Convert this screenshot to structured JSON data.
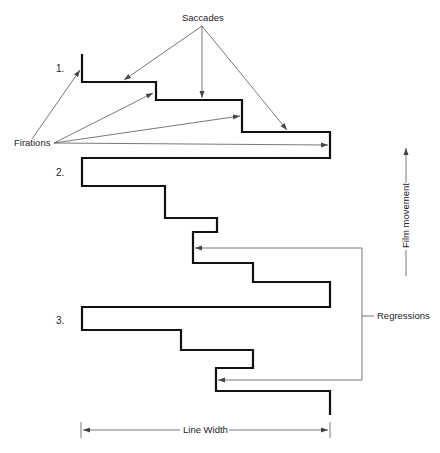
{
  "diagram": {
    "labels": {
      "saccades": "Saccades",
      "fixations": "Firations",
      "regressions": "Regressions",
      "film_movement": "Film movement",
      "line_width": "Line Width"
    },
    "line_numbers": [
      "1.",
      "2.",
      "3."
    ],
    "colors": {
      "trace": "#111111",
      "annotation": "#555555",
      "background": "#ffffff"
    }
  }
}
